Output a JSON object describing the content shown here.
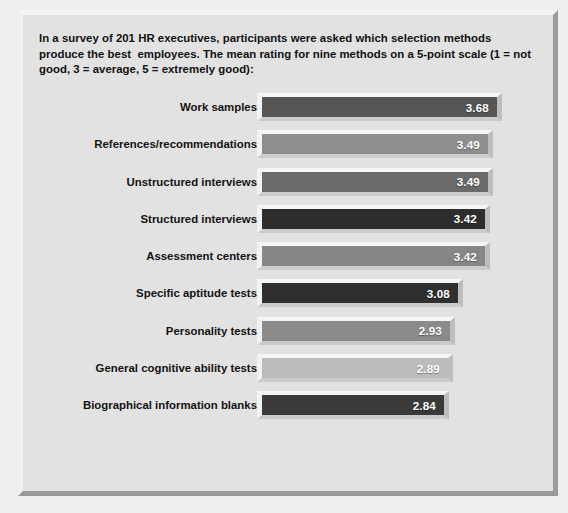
{
  "intro": {
    "text": "In a survey of 201 HR executives, participants were asked which selection methods produce the best  employees. The mean rating for nine methods on a 5-point scale (1 = not good, 3 = average, 5 = extremely good):"
  },
  "colors": {
    "page_background": "#efefef",
    "plate_background": "#e2e2e2",
    "frame_highlight": "#f4f4f4",
    "frame_shadow": "#9a9a9a",
    "value_text": "#ffffff",
    "label_text": "#131313"
  },
  "chart_data": {
    "type": "bar",
    "orientation": "horizontal",
    "title": "",
    "subtitle": "",
    "xlabel": "",
    "ylabel": "",
    "xlim": [
      0,
      5
    ],
    "grid": false,
    "legend": false,
    "scale_note": "5-point scale (1 = not good, 3 = average, 5 = extremely good)",
    "categories": [
      "Work samples",
      "References/recommendations",
      "Unstructured interviews",
      "Structured interviews",
      "Assessment centers",
      "Specific aptitude tests",
      "Personality tests",
      "General cognitive ability tests",
      "Biographical information blanks"
    ],
    "values": [
      3.68,
      3.49,
      3.49,
      3.42,
      3.42,
      3.08,
      2.93,
      2.89,
      2.84
    ],
    "value_labels": [
      "3.68",
      "3.49",
      "3.49",
      "3.42",
      "3.42",
      "3.08",
      "2.93",
      "2.89",
      "2.84"
    ],
    "bar_colors": [
      "#555555",
      "#8e8e8e",
      "#6a6a6a",
      "#2d2d2d",
      "#868686",
      "#2f2f2f",
      "#8b8b8b",
      "#bcbcbc",
      "#3a3a3a"
    ],
    "bar_pixel_widths": [
      245,
      236,
      236,
      233,
      233,
      206,
      198,
      196,
      192
    ]
  }
}
